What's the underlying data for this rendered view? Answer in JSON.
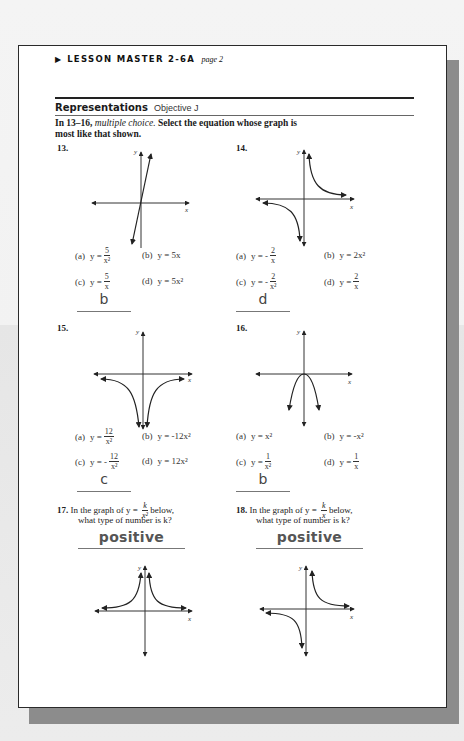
{
  "header": {
    "arrow_icon": "right-triangle",
    "title": "LESSON MASTER 2-6A",
    "page_label": "page 2"
  },
  "section": {
    "title": "Representations",
    "objective": "Objective J"
  },
  "instructions": {
    "prefix": "In 13–16, ",
    "italic": "multiple choice.",
    "rest": " Select the equation whose graph is most like that shown."
  },
  "questions": [
    {
      "number": "13.",
      "graph": "steep line through origin, positive slope",
      "axis_x": "x",
      "axis_y": "y",
      "options": [
        {
          "label": "(a)",
          "lhs": "y =",
          "num": "5",
          "den": "x²"
        },
        {
          "label": "(b)",
          "text": "y = 5x"
        },
        {
          "label": "(c)",
          "lhs": "y =",
          "num": "5",
          "den": "x"
        },
        {
          "label": "(d)",
          "text": "y = 5x²"
        }
      ],
      "answer": "b"
    },
    {
      "number": "14.",
      "graph": "hyperbola in quadrants I and III",
      "axis_x": "x",
      "axis_y": "y",
      "options": [
        {
          "label": "(a)",
          "lhs": "y = -",
          "num": "2",
          "den": "x"
        },
        {
          "label": "(b)",
          "text": "y = 2x²"
        },
        {
          "label": "(c)",
          "lhs": "y = -",
          "num": "2",
          "den": "x²"
        },
        {
          "label": "(d)",
          "lhs": "y =",
          "num": "2",
          "den": "x"
        }
      ],
      "answer": "d"
    },
    {
      "number": "15.",
      "graph": "inverse-square curve below x-axis",
      "axis_x": "x",
      "axis_y": "y",
      "options": [
        {
          "label": "(a)",
          "lhs": "y =",
          "num": "12",
          "den": "x²"
        },
        {
          "label": "(b)",
          "text": "y = -12x²"
        },
        {
          "label": "(c)",
          "lhs": "y = -",
          "num": "12",
          "den": "x²"
        },
        {
          "label": "(d)",
          "text": "y = 12x²"
        }
      ],
      "answer": "c"
    },
    {
      "number": "16.",
      "graph": "downward-opening parabola through origin",
      "axis_x": "x",
      "axis_y": "y",
      "options": [
        {
          "label": "(a)",
          "text": "y = x²"
        },
        {
          "label": "(b)",
          "text": "y = -x²"
        },
        {
          "label": "(c)",
          "lhs": "y =",
          "num": "1",
          "den": "x²"
        },
        {
          "label": "(d)",
          "lhs": "y =",
          "num": "1",
          "den": "x"
        }
      ],
      "answer": "b"
    },
    {
      "number": "17.",
      "text_before": "In the graph of y =",
      "frac_num": "k",
      "frac_den": "x²",
      "text_after": "below,",
      "line2": "what type of number is k?",
      "graph": "inverse-square curve above x-axis",
      "axis_x": "x",
      "axis_y": "y",
      "answer": "positive"
    },
    {
      "number": "18.",
      "text_before": "In the graph of y =",
      "frac_num": "k",
      "frac_den": "x",
      "text_after": "below,",
      "line2": "what type of number is k?",
      "graph": "hyperbola in quadrants I and III",
      "axis_x": "x",
      "axis_y": "y",
      "answer": "positive"
    }
  ],
  "colors": {
    "page": "#ffffff",
    "border": "#2a2a2a",
    "shadow": "#8c8c8c",
    "answer_text": "#444444"
  }
}
